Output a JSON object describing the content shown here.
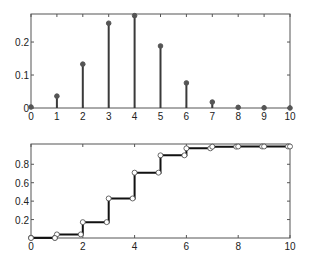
{
  "chart_data": [
    {
      "type": "stem",
      "title": "",
      "xlabel": "",
      "ylabel": "",
      "x": [
        0,
        1,
        2,
        3,
        4,
        5,
        6,
        7,
        8,
        9,
        10
      ],
      "values": [
        0.003,
        0.036,
        0.133,
        0.257,
        0.28,
        0.188,
        0.076,
        0.018,
        0.002,
        0.0005,
        0.0
      ],
      "xlim": [
        0,
        10
      ],
      "ylim": [
        0,
        0.285
      ],
      "xticks": [
        0,
        1,
        2,
        3,
        4,
        5,
        6,
        7,
        8,
        9,
        10
      ],
      "yticks": [
        0,
        0.1,
        0.2
      ],
      "ytick_labels": [
        "0",
        "0.1",
        "0.2"
      ],
      "grid": false,
      "legend": null
    },
    {
      "type": "line",
      "subtype": "step (cumulative distribution)",
      "title": "",
      "xlabel": "",
      "ylabel": "",
      "x": [
        0,
        1,
        2,
        3,
        4,
        5,
        6,
        7,
        8,
        9,
        10
      ],
      "values": [
        0.003,
        0.039,
        0.172,
        0.429,
        0.709,
        0.897,
        0.973,
        0.991,
        0.993,
        0.993,
        0.993
      ],
      "xlim": [
        0,
        10
      ],
      "ylim": [
        0,
        1.02
      ],
      "xticks": [
        0,
        2,
        4,
        6,
        8,
        10
      ],
      "yticks": [
        0.2,
        0.4,
        0.6,
        0.8
      ],
      "ytick_labels": [
        "0.2",
        "0.4",
        "0.6",
        "0.8"
      ],
      "markers": "open circles at step endpoints",
      "grid": false,
      "legend": null
    }
  ],
  "style": {
    "stem_color": "#3a3a3a",
    "marker_color": "#555555",
    "axis_color": "#555555",
    "step_color": "#111111"
  }
}
